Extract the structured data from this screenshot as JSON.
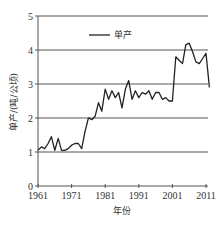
{
  "chart_data": {
    "type": "line",
    "title": "",
    "xlabel": "年份",
    "ylabel": "单产/(吨/公顷)",
    "xlim": [
      1961,
      2012
    ],
    "ylim": [
      0,
      5
    ],
    "grid": "horizontal",
    "x_ticks": [
      "1961",
      "1971",
      "1981",
      "1991",
      "2001",
      "2011"
    ],
    "y_ticks": [
      "0",
      "1",
      "2",
      "3",
      "4",
      "5"
    ],
    "legend": {
      "position": "upper-left-inside",
      "entries": [
        "单产"
      ]
    },
    "series": [
      {
        "name": "单产",
        "color": "#222222",
        "x": [
          1961,
          1962,
          1963,
          1964,
          1965,
          1966,
          1967,
          1968,
          1969,
          1970,
          1971,
          1972,
          1973,
          1974,
          1975,
          1976,
          1977,
          1978,
          1979,
          1980,
          1981,
          1982,
          1983,
          1984,
          1985,
          1986,
          1987,
          1988,
          1989,
          1990,
          1991,
          1992,
          1993,
          1994,
          1995,
          1996,
          1997,
          1998,
          1999,
          2000,
          2001,
          2002,
          2003,
          2004,
          2005,
          2006,
          2007,
          2008,
          2009,
          2010,
          2011,
          2012
        ],
        "values": [
          1.05,
          1.15,
          1.1,
          1.25,
          1.45,
          1.05,
          1.4,
          1.05,
          1.05,
          1.1,
          1.2,
          1.25,
          1.25,
          1.1,
          1.6,
          2.0,
          1.95,
          2.05,
          2.45,
          2.2,
          2.85,
          2.55,
          2.8,
          2.6,
          2.75,
          2.3,
          2.85,
          3.1,
          2.55,
          2.8,
          2.6,
          2.75,
          2.7,
          2.8,
          2.55,
          2.75,
          2.75,
          2.55,
          2.6,
          2.5,
          2.5,
          3.8,
          3.7,
          3.6,
          4.15,
          4.2,
          3.95,
          3.65,
          3.6,
          3.75,
          3.9,
          2.9
        ]
      }
    ]
  },
  "labels": {
    "xlabel": "年份",
    "ylabel": "单产/(吨/公顷)",
    "legend": "单产"
  }
}
